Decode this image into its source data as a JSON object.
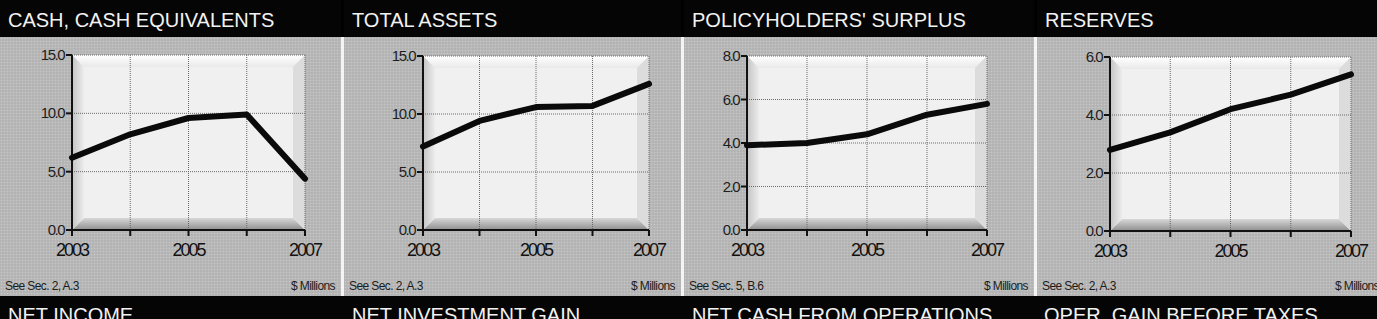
{
  "colors": {
    "header_bg": "#050505",
    "header_text": "#f2f2f2",
    "panel_bg": "#b9b9b9",
    "plot_bg": "#f2f2f2",
    "line": "#0a0a0a",
    "separator": "#f4f4f4"
  },
  "panels": [
    {
      "title": "CASH, CASH EQUIVALENTS",
      "footnote_left": "See Sec. 2, A.3",
      "footnote_right": "$ Millions",
      "y_ticks": [
        "15.0",
        "10.0",
        "5.0",
        "0.0"
      ],
      "x_ticks": [
        "2003",
        "2005",
        "2007"
      ]
    },
    {
      "title": "TOTAL ASSETS",
      "footnote_left": "See Sec. 2, A.3",
      "footnote_right": "$ Millions",
      "y_ticks": [
        "15.0",
        "10.0",
        "5.0",
        "0.0"
      ],
      "x_ticks": [
        "2003",
        "2005",
        "2007"
      ]
    },
    {
      "title": "POLICYHOLDERS' SURPLUS",
      "footnote_left": "See Sec. 5, B.6",
      "footnote_right": "$ Millions",
      "y_ticks": [
        "8.0",
        "6.0",
        "4.0",
        "2.0",
        "0.0"
      ],
      "x_ticks": [
        "2003",
        "2005",
        "2007"
      ]
    },
    {
      "title": "RESERVES",
      "footnote_left": "See Sec. 2, A.3",
      "footnote_right": "$ Millions",
      "y_ticks": [
        "6.0",
        "4.0",
        "2.0",
        "0.0"
      ],
      "x_ticks": [
        "2003",
        "2005",
        "2007"
      ]
    }
  ],
  "bottom_titles": [
    "NET INCOME",
    "NET INVESTMENT GAIN",
    "NET CASH FROM OPERATIONS",
    "OPER. GAIN BEFORE TAXES"
  ],
  "chart_data": [
    {
      "type": "line",
      "title": "CASH, CASH EQUIVALENTS",
      "x": [
        2003,
        2004,
        2005,
        2006,
        2007
      ],
      "values": [
        6.2,
        8.2,
        9.6,
        9.9,
        4.4
      ],
      "xlabel": "",
      "ylabel": "$ Millions",
      "ylim": [
        0,
        15
      ],
      "yticks": [
        0,
        5,
        10,
        15
      ],
      "xticks": [
        2003,
        2005,
        2007
      ],
      "grid": true,
      "legend": "none",
      "annotations": [
        "See Sec. 2, A.3",
        "$ Millions"
      ]
    },
    {
      "type": "line",
      "title": "TOTAL ASSETS",
      "x": [
        2003,
        2004,
        2005,
        2006,
        2007
      ],
      "values": [
        7.2,
        9.4,
        10.6,
        10.7,
        12.6
      ],
      "xlabel": "",
      "ylabel": "$ Millions",
      "ylim": [
        0,
        15
      ],
      "yticks": [
        0,
        5,
        10,
        15
      ],
      "xticks": [
        2003,
        2005,
        2007
      ],
      "grid": true,
      "legend": "none",
      "annotations": [
        "See Sec. 2, A.3",
        "$ Millions"
      ]
    },
    {
      "type": "line",
      "title": "POLICYHOLDERS' SURPLUS",
      "x": [
        2003,
        2004,
        2005,
        2006,
        2007
      ],
      "values": [
        3.9,
        4.0,
        4.4,
        5.3,
        5.8
      ],
      "xlabel": "",
      "ylabel": "$ Millions",
      "ylim": [
        0,
        8
      ],
      "yticks": [
        0,
        2,
        4,
        6,
        8
      ],
      "xticks": [
        2003,
        2005,
        2007
      ],
      "grid": true,
      "legend": "none",
      "annotations": [
        "See Sec. 5, B.6",
        "$ Millions"
      ]
    },
    {
      "type": "line",
      "title": "RESERVES",
      "x": [
        2003,
        2004,
        2005,
        2006,
        2007
      ],
      "values": [
        2.8,
        3.4,
        4.2,
        4.7,
        5.4
      ],
      "xlabel": "",
      "ylabel": "$ Millions",
      "ylim": [
        0,
        6
      ],
      "yticks": [
        0,
        2,
        4,
        6
      ],
      "xticks": [
        2003,
        2005,
        2007
      ],
      "grid": true,
      "legend": "none",
      "annotations": [
        "See Sec. 2, A.3",
        "$ Millions"
      ]
    }
  ]
}
